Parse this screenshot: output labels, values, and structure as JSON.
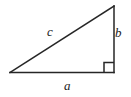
{
  "figure": {
    "kind": "right-triangle-diagram",
    "background_color": "#ffffff",
    "stroke_color": "#262626",
    "stroke_width": 1.5,
    "label_color": "#1c1c1c"
  },
  "geometry": {
    "vertices": {
      "left": {
        "x": 10,
        "y": 72.5
      },
      "top_right": {
        "x": 114,
        "y": 6
      },
      "bottom_right": {
        "x": 114,
        "y": 72.5
      }
    },
    "right_angle_marker": {
      "at_vertex": "bottom_right",
      "x": 104,
      "y": 62.5,
      "size": 10
    }
  },
  "labels": {
    "hypotenuse": {
      "text": "c",
      "x": 52,
      "y": 31
    },
    "vertical_leg": {
      "text": "b",
      "x": 119,
      "y": 32
    },
    "horizontal_leg": {
      "text": "a",
      "x": 68,
      "y": 85
    }
  }
}
